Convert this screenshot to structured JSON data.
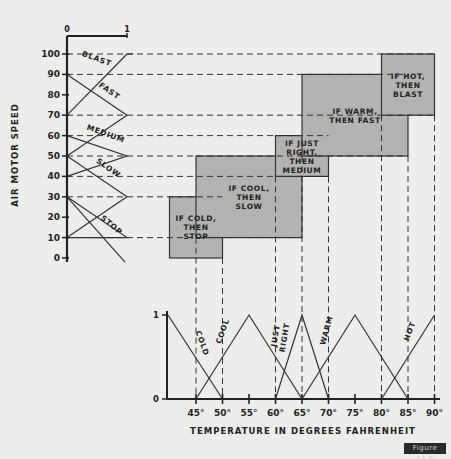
{
  "chart_data": {
    "type": "diagram",
    "title": "",
    "figure_label": "Figure 11.6",
    "speed_axis": {
      "label": "Air Motor Speed",
      "ticks": [
        0,
        10,
        20,
        30,
        40,
        50,
        60,
        70,
        80,
        90,
        100
      ],
      "membership_labels": [
        "0",
        "1"
      ]
    },
    "speed_sets": [
      {
        "name": "Stop",
        "points": [
          [
            0,
            10
          ],
          [
            1,
            10
          ],
          [
            0,
            30
          ]
        ],
        "label": "Stop"
      },
      {
        "name": "Slow",
        "points": [
          [
            0,
            10
          ],
          [
            1,
            30
          ],
          [
            0,
            50
          ]
        ],
        "label": "Slow"
      },
      {
        "name": "Medium",
        "points": [
          [
            0,
            40
          ],
          [
            1,
            50
          ],
          [
            0,
            60
          ]
        ],
        "label": "Medium"
      },
      {
        "name": "Fast",
        "points": [
          [
            0,
            50
          ],
          [
            1,
            70
          ],
          [
            0,
            90
          ]
        ],
        "label": "Fast"
      },
      {
        "name": "Blast",
        "points": [
          [
            0,
            70
          ],
          [
            1,
            100
          ]
        ],
        "label": "Blast"
      }
    ],
    "temp_axis": {
      "label": "Temperature in Degrees Fahrenheit",
      "ticks": [
        "45°",
        "50°",
        "55°",
        "60°",
        "65°",
        "70°",
        "75°",
        "80°",
        "85°",
        "90°"
      ],
      "tick_values": [
        45,
        50,
        55,
        60,
        65,
        70,
        75,
        80,
        85,
        90
      ],
      "membership_labels": [
        "0",
        "1"
      ]
    },
    "temp_sets": [
      {
        "name": "Cold",
        "points": [
          [
            40,
            1
          ],
          [
            50,
            0
          ]
        ]
      },
      {
        "name": "Cool",
        "points": [
          [
            45,
            0
          ],
          [
            55,
            1
          ],
          [
            65,
            0
          ]
        ]
      },
      {
        "name": "Just Right",
        "points": [
          [
            60,
            0
          ],
          [
            65,
            1
          ],
          [
            70,
            0
          ]
        ]
      },
      {
        "name": "Warm",
        "points": [
          [
            65,
            0
          ],
          [
            75,
            1
          ],
          [
            85,
            0
          ]
        ]
      },
      {
        "name": "Hot",
        "points": [
          [
            80,
            0
          ],
          [
            90,
            1
          ]
        ]
      }
    ],
    "rules": [
      {
        "text": [
          "If Cold,",
          "Then",
          "Stop"
        ],
        "temp_range": [
          40,
          50
        ],
        "speed_range": [
          0,
          30
        ]
      },
      {
        "text": [
          "If Cool,",
          "Then",
          "Slow"
        ],
        "temp_range": [
          45,
          65
        ],
        "speed_range": [
          10,
          50
        ]
      },
      {
        "text": [
          "If Just",
          "Right,",
          "Then",
          "Medium"
        ],
        "temp_range": [
          60,
          70
        ],
        "speed_range": [
          40,
          60
        ]
      },
      {
        "text": [
          "If Warm,",
          "Then Fast"
        ],
        "temp_range": [
          65,
          85
        ],
        "speed_range": [
          50,
          90
        ]
      },
      {
        "text": [
          "If Hot,",
          "Then",
          "Blast"
        ],
        "temp_range": [
          80,
          90
        ],
        "speed_range": [
          70,
          100
        ]
      }
    ]
  }
}
